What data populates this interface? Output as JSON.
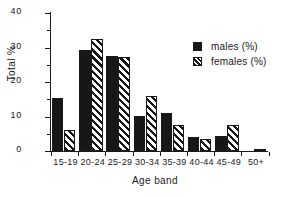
{
  "chart_data": {
    "type": "bar",
    "title": "",
    "xlabel": "Age band",
    "ylabel": "Total %",
    "categories": [
      "15-19",
      "20-24",
      "25-29",
      "30-34",
      "35-39",
      "40-44",
      "45-49",
      "50+"
    ],
    "series": [
      {
        "name": "males (%)",
        "values": [
          15.5,
          29.2,
          27.5,
          10.2,
          11.0,
          4.0,
          4.4,
          0.0
        ]
      },
      {
        "name": "females (%)",
        "values": [
          6.2,
          32.5,
          27.3,
          16.0,
          7.5,
          3.5,
          7.5,
          0.7
        ]
      }
    ],
    "ylim": [
      0,
      40
    ],
    "yticks": [
      0,
      10,
      20,
      30,
      40
    ],
    "yticklabels": [
      "0",
      "10",
      "20",
      "30",
      "40"
    ],
    "yminorticks": [
      5,
      15,
      25,
      35
    ],
    "grid": false,
    "legend_position": "top-right",
    "legend": [
      "males (%)",
      "females (%)"
    ],
    "colors": {
      "males": "#171717",
      "females": "#ffffff",
      "hatch": "#151515",
      "axis": "#1a1a1a",
      "background": "#ffffff"
    }
  },
  "axes": {
    "ylabel": "Total %",
    "xlabel": "Age band"
  },
  "legend": {
    "males_label": "males (%)",
    "females_label": "females (%)"
  }
}
